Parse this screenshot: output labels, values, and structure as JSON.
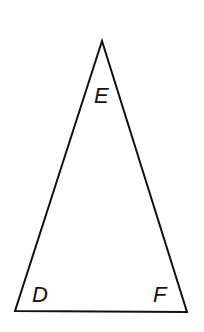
{
  "diagram": {
    "type": "triangle",
    "vertices": [
      {
        "name": "E",
        "position": "apex"
      },
      {
        "name": "D",
        "position": "bottom-left"
      },
      {
        "name": "F",
        "position": "bottom-right"
      }
    ],
    "labels": {
      "top": "E",
      "left": "D",
      "right": "F"
    },
    "stroke_color": "#111111",
    "background": "#ffffff"
  }
}
